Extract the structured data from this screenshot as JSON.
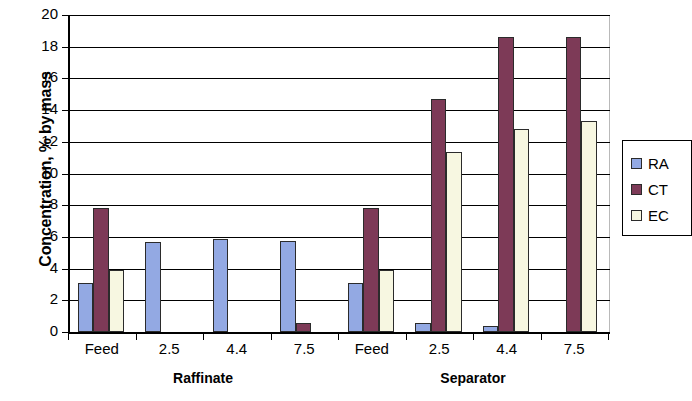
{
  "chart_data": {
    "type": "bar",
    "title": "",
    "xlabel": "",
    "ylabel": "Concentration, % by mass",
    "ylim": [
      0,
      20
    ],
    "yticks": [
      0,
      2,
      4,
      6,
      8,
      10,
      12,
      14,
      16,
      18,
      20
    ],
    "grid": true,
    "legend_position": "right",
    "groups": [
      {
        "label": "Raffinate",
        "categories": [
          "Feed",
          "2.5",
          "4.4",
          "7.5"
        ]
      },
      {
        "label": "Separator",
        "categories": [
          "Feed",
          "2.5",
          "4.4",
          "7.5"
        ]
      }
    ],
    "categories": [
      "Feed",
      "2.5",
      "4.4",
      "7.5",
      "Feed",
      "2.5",
      "4.4",
      "7.5"
    ],
    "series": [
      {
        "name": "RA",
        "color": "#93a9e3",
        "values": [
          3.1,
          5.7,
          5.85,
          5.75,
          3.1,
          0.6,
          0.35,
          0
        ]
      },
      {
        "name": "CT",
        "color": "#7d3a57",
        "values": [
          7.8,
          0,
          0,
          0.6,
          7.8,
          14.7,
          18.6,
          18.6
        ]
      },
      {
        "name": "EC",
        "color": "#f7f7e1",
        "values": [
          3.9,
          0,
          0,
          0,
          3.9,
          11.35,
          12.8,
          13.3
        ]
      }
    ]
  },
  "legend": {
    "entries": [
      {
        "label": "RA",
        "color": "#93a9e3"
      },
      {
        "label": "CT",
        "color": "#7d3a57"
      },
      {
        "label": "EC",
        "color": "#f7f7e1"
      }
    ]
  },
  "axis": {
    "y_title": "Concentration, % by mass"
  }
}
